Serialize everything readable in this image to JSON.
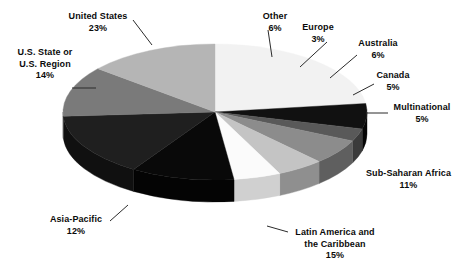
{
  "chart_data": {
    "type": "pie",
    "title": "",
    "subtitle": "",
    "xlabel": "",
    "ylabel": "",
    "legend_position": "none",
    "grid": false,
    "style": "3d-exploded-none",
    "label_format": "name + percent",
    "categories": [
      "United States",
      "Other",
      "Europe",
      "Australia",
      "Canada",
      "Multinational",
      "Sub-Saharan Africa",
      "Latin America and the Caribbean",
      "Asia-Pacific",
      "U.S. State or U.S. Region"
    ],
    "values": [
      23,
      6,
      3,
      6,
      5,
      5,
      11,
      15,
      12,
      14
    ],
    "value_labels": [
      "23%",
      "6%",
      "3%",
      "6%",
      "5%",
      "5%",
      "11%",
      "15%",
      "12%",
      "14%"
    ],
    "units": "percent",
    "total": 100,
    "slices": [
      {
        "name": "United States",
        "label_line1": "United States",
        "label_line2": "",
        "percent_label": "23%",
        "value": 23,
        "color": "#f2f2f2",
        "side_color": "#c9c9c9",
        "start_angle": 0,
        "end_angle": 82.8,
        "leader": true
      },
      {
        "name": "Other",
        "label_line1": "Other",
        "label_line2": "",
        "percent_label": "6%",
        "value": 6,
        "color": "#111111",
        "side_color": "#060606",
        "start_angle": 82.8,
        "end_angle": 104.4,
        "leader": true
      },
      {
        "name": "Europe",
        "label_line1": "Europe",
        "label_line2": "",
        "percent_label": "3%",
        "value": 3,
        "color": "#595959",
        "side_color": "#3b3b3b",
        "start_angle": 104.4,
        "end_angle": 115.2,
        "leader": true
      },
      {
        "name": "Australia",
        "label_line1": "Australia",
        "label_line2": "",
        "percent_label": "6%",
        "value": 6,
        "color": "#8c8c8c",
        "side_color": "#5f5f5f",
        "start_angle": 115.2,
        "end_angle": 136.8,
        "leader": true
      },
      {
        "name": "Canada",
        "label_line1": "Canada",
        "label_line2": "",
        "percent_label": "5%",
        "value": 5,
        "color": "#c4c4c4",
        "side_color": "#8f8f8f",
        "start_angle": 136.8,
        "end_angle": 154.8,
        "leader": true
      },
      {
        "name": "Multinational",
        "label_line1": "Multinational",
        "label_line2": "",
        "percent_label": "5%",
        "value": 5,
        "color": "#fbfbfb",
        "side_color": "#d0d0d0",
        "start_angle": 154.8,
        "end_angle": 172.8,
        "leader": true
      },
      {
        "name": "Sub-Saharan Africa",
        "label_line1": "Sub-Saharan Africa",
        "label_line2": "",
        "percent_label": "11%",
        "value": 11,
        "color": "#090909",
        "side_color": "#040404",
        "start_angle": 172.8,
        "end_angle": 212.4,
        "leader": false
      },
      {
        "name": "Latin America and the Caribbean",
        "label_line1": "Latin America and",
        "label_line2": "the Caribbean",
        "percent_label": "15%",
        "value": 15,
        "color": "#1f1f1f",
        "side_color": "#101010",
        "start_angle": 212.4,
        "end_angle": 266.4,
        "leader": true
      },
      {
        "name": "Asia-Pacific",
        "label_line1": "Asia-Pacific",
        "label_line2": "",
        "percent_label": "12%",
        "value": 12,
        "color": "#7a7a7a",
        "side_color": "#4f4f4f",
        "start_angle": 266.4,
        "end_angle": 309.6,
        "leader": true
      },
      {
        "name": "U.S. State or U.S. Region",
        "label_line1": "U.S. State or",
        "label_line2": "U.S. Region",
        "percent_label": "14%",
        "value": 14,
        "color": "#b5b5b5",
        "side_color": "#838383",
        "start_angle": 309.6,
        "end_angle": 360,
        "leader": true
      }
    ],
    "geometry": {
      "center_x": 215,
      "center_y": 112,
      "radius_x": 152,
      "radius_y": 68,
      "depth": 22
    },
    "background_color": "#ffffff",
    "label_color": "#0b0b0b",
    "leader_color": "#2b2b2b"
  }
}
